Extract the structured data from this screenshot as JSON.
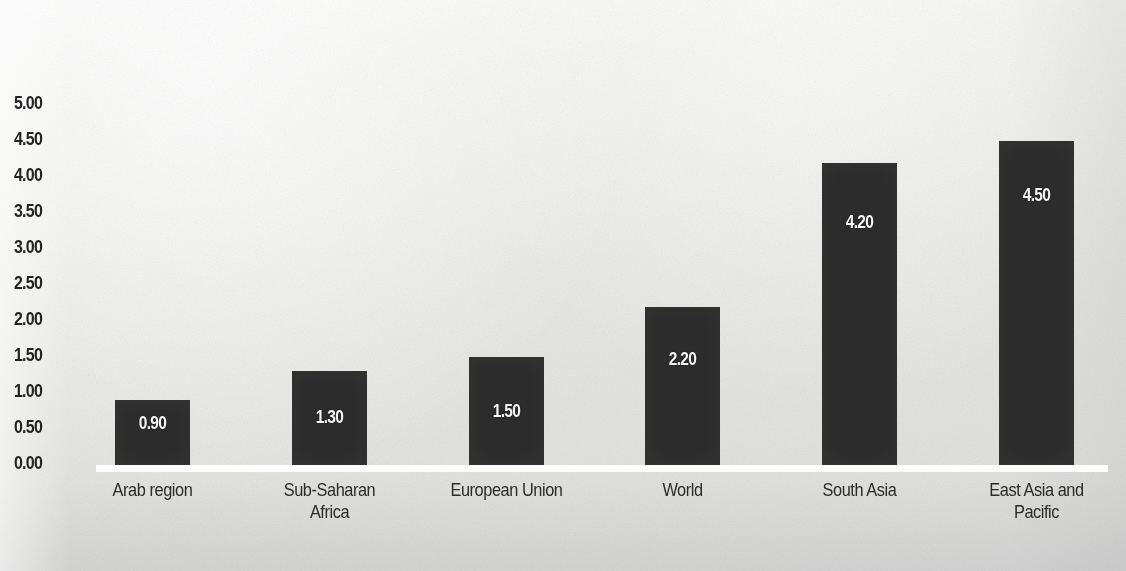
{
  "chart_data": {
    "type": "bar",
    "title": "",
    "subtitle": "",
    "xlabel": "",
    "ylabel": "",
    "categories": [
      "Arab region",
      "Sub-Saharan\nAfrica",
      "European Union",
      "World",
      "South Asia",
      "East Asia and\nPacific"
    ],
    "values": [
      0.9,
      1.3,
      1.5,
      2.2,
      4.2,
      4.5
    ],
    "value_labels": [
      "0.90",
      "1.30",
      "1.50",
      "2.20",
      "4.20",
      "4.50"
    ],
    "ylim": [
      0,
      5
    ],
    "ytick_step": 0.5,
    "ytick_labels": [
      "5.00",
      "4.50",
      "4.00",
      "3.50",
      "3.00",
      "2.50",
      "2.00",
      "1.50",
      "1.00",
      "0.50",
      "0.00"
    ],
    "ytick_values": [
      5.0,
      4.5,
      4.0,
      3.5,
      3.0,
      2.5,
      2.0,
      1.5,
      1.0,
      0.5,
      0.0
    ],
    "grid": false,
    "legend": null,
    "legend_position": "none",
    "bar_color": "#2c2c2c",
    "value_label_color": "#f4f4f4",
    "axis_label_color": "#232323",
    "category_label_color": "#2b2b2b",
    "baseline_color": "#ffffff",
    "background_color": "#e9e9e6"
  },
  "geometry": {
    "baseline_y": 465,
    "px_per_unit": 72,
    "bar_width": 75,
    "bar_left_positions": [
      115,
      292,
      469,
      645,
      822,
      999
    ]
  }
}
